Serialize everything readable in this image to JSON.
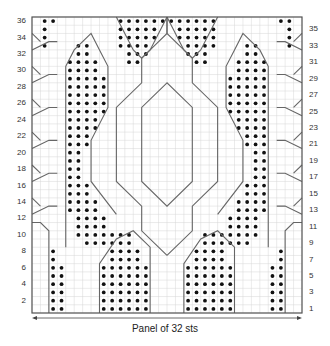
{
  "chart": {
    "title": "Panel of 32 sts",
    "stitches": 32,
    "rows": 36,
    "left_row_labels": [
      "2",
      "4",
      "6",
      "8",
      "10",
      "12",
      "14",
      "16",
      "18",
      "20",
      "22",
      "24",
      "26",
      "28",
      "30",
      "32",
      "34",
      "36"
    ],
    "right_row_labels": [
      "1",
      "3",
      "5",
      "7",
      "9",
      "11",
      "13",
      "15",
      "17",
      "19",
      "21",
      "23",
      "25",
      "27",
      "29",
      "31",
      "33",
      "35"
    ],
    "colors": {
      "grid": "#d6d6d6",
      "border": "#555555",
      "line": "#666666",
      "dot": "#111111"
    }
  },
  "chart_data": {
    "type": "table",
    "title": "Panel of 32 sts",
    "xlabel": "Panel of 32 sts",
    "ylabel": "Rows",
    "columns": 32,
    "rows": 36,
    "dots_left_half_by_row": {
      "1": [
        [
          3,
          4
        ],
        [
          9,
          14
        ]
      ],
      "2": [
        [
          3,
          4
        ],
        [
          9,
          14
        ]
      ],
      "3": [
        [
          3,
          4
        ],
        [
          9,
          14
        ]
      ],
      "4": [
        [
          3,
          4
        ],
        [
          9,
          14
        ]
      ],
      "5": [
        [
          3,
          4
        ],
        [
          9,
          14
        ]
      ],
      "6": [
        [
          3,
          4
        ],
        [
          9,
          14
        ]
      ],
      "7": [
        [
          3,
          3
        ],
        [
          10,
          13
        ]
      ],
      "8": [
        [
          3,
          3
        ],
        [
          10,
          13
        ]
      ],
      "9": [
        [
          7,
          10
        ],
        [
          11,
          12
        ]
      ],
      "10": [
        [
          6,
          10
        ],
        [
          11,
          12
        ]
      ],
      "11": [
        [
          6,
          9
        ]
      ],
      "12": [
        [
          6,
          9
        ]
      ],
      "13": [
        [
          5,
          8
        ]
      ],
      "14": [
        [
          5,
          8
        ]
      ],
      "15": [
        [
          5,
          7
        ]
      ],
      "16": [
        [
          5,
          7
        ]
      ],
      "17": [
        [
          5,
          6
        ]
      ],
      "18": [
        [
          5,
          6
        ]
      ],
      "19": [
        [
          5,
          6
        ]
      ],
      "20": [
        [
          5,
          6
        ]
      ],
      "21": [
        [
          5,
          7
        ]
      ],
      "22": [
        [
          5,
          7
        ]
      ],
      "23": [
        [
          5,
          8
        ]
      ],
      "24": [
        [
          5,
          8
        ]
      ],
      "25": [
        [
          5,
          9
        ]
      ],
      "26": [
        [
          5,
          9
        ]
      ],
      "27": [
        [
          5,
          9
        ]
      ],
      "28": [
        [
          5,
          9
        ]
      ],
      "29": [
        [
          5,
          9
        ]
      ],
      "30": [
        [
          5,
          8
        ]
      ],
      "31": [
        [
          5,
          8
        ],
        [
          12,
          13
        ]
      ],
      "32": [
        [
          6,
          7
        ],
        [
          12,
          14
        ]
      ],
      "33": [
        [
          6,
          7
        ],
        [
          11,
          14
        ],
        [
          2,
          2
        ]
      ],
      "34": [
        [
          2,
          2
        ],
        [
          11,
          15
        ]
      ],
      "35": [
        [
          2,
          2
        ],
        [
          11,
          15
        ]
      ],
      "36": [
        [
          2,
          3
        ],
        [
          11,
          16
        ]
      ]
    },
    "symmetry": "mirror about center (cols 16|17)"
  }
}
